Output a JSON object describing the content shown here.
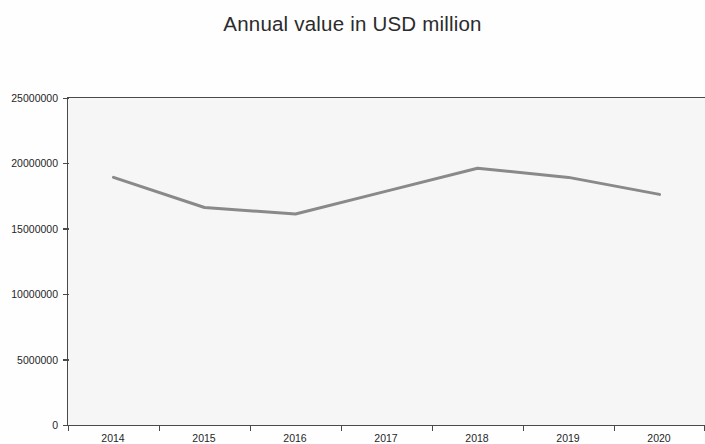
{
  "chart_data": {
    "type": "line",
    "title": "Annual value in USD million",
    "xlabel": "",
    "ylabel": "",
    "categories": [
      "2014",
      "2015",
      "2016",
      "2017",
      "2018",
      "2019",
      "2020"
    ],
    "values": [
      18900000,
      16600000,
      16100000,
      17850000,
      19600000,
      18900000,
      17600000
    ],
    "series": [
      {
        "name": "Annual value",
        "values": [
          18900000,
          16600000,
          16100000,
          17850000,
          19600000,
          18900000,
          17600000
        ]
      }
    ],
    "ylim": [
      0,
      25000000
    ],
    "ytick_labels": [
      "0",
      "5000000",
      "10000000",
      "15000000",
      "20000000",
      "25000000"
    ],
    "ytick_values": [
      0,
      5000000,
      10000000,
      15000000,
      20000000,
      25000000
    ],
    "xtick_labels": [
      "2014",
      "2015",
      "2016",
      "2017",
      "2018",
      "2019",
      "2020"
    ],
    "grid": false,
    "legend": "none",
    "line_color": "#8a8a8a",
    "plot_background": "#f7f7f7",
    "page_background": "#ffffff",
    "axis_color": "#4a4a4a",
    "title_color": "#2b2b2b"
  }
}
